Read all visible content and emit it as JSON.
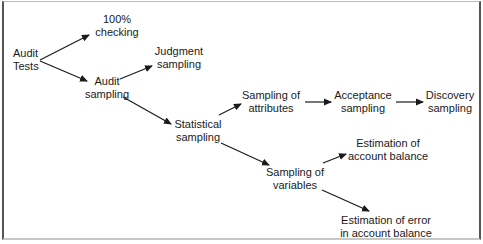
{
  "diagram": {
    "type": "flow",
    "nodes": [
      {
        "id": "audit_tests",
        "line1": "Audit",
        "line2": "Tests"
      },
      {
        "id": "checking_100",
        "line1": "100%",
        "line2": "checking"
      },
      {
        "id": "audit_sampling",
        "line1": "Audit",
        "line2": "sampling"
      },
      {
        "id": "judgment_sampling",
        "line1": "Judgment",
        "line2": "sampling"
      },
      {
        "id": "statistical_sampling",
        "line1": "Statistical",
        "line2": "sampling"
      },
      {
        "id": "sampling_attributes",
        "line1": "Sampling of",
        "line2": "attributes"
      },
      {
        "id": "acceptance_sampling",
        "line1": "Acceptance",
        "line2": "sampling"
      },
      {
        "id": "discovery_sampling",
        "line1": "Discovery",
        "line2": "sampling"
      },
      {
        "id": "sampling_variables",
        "line1": "Sampling of",
        "line2": "variables"
      },
      {
        "id": "estimation_balance",
        "line1": "Estimation of",
        "line2": "account balance"
      },
      {
        "id": "estimation_error",
        "line1": "Estimation of error",
        "line2": "in account balance"
      }
    ],
    "edges": [
      {
        "from": "audit_tests",
        "to": "checking_100"
      },
      {
        "from": "audit_tests",
        "to": "audit_sampling"
      },
      {
        "from": "audit_sampling",
        "to": "judgment_sampling"
      },
      {
        "from": "audit_sampling",
        "to": "statistical_sampling"
      },
      {
        "from": "statistical_sampling",
        "to": "sampling_attributes"
      },
      {
        "from": "sampling_attributes",
        "to": "acceptance_sampling"
      },
      {
        "from": "acceptance_sampling",
        "to": "discovery_sampling"
      },
      {
        "from": "statistical_sampling",
        "to": "sampling_variables"
      },
      {
        "from": "sampling_variables",
        "to": "estimation_balance"
      },
      {
        "from": "sampling_variables",
        "to": "estimation_error"
      }
    ],
    "colors": {
      "line": "#1a1a1a",
      "text": "#1a1a1a",
      "frame": "#555555"
    }
  }
}
